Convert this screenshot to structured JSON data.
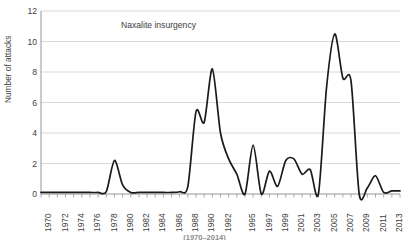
{
  "chart_data": {
    "type": "line",
    "title": "",
    "annotation": "Naxalite insurgency",
    "xlabel": "",
    "ylabel": "Number of attacks",
    "ylim": [
      0,
      12
    ],
    "yticks": [
      0,
      2,
      4,
      6,
      8,
      10,
      12
    ],
    "xlim": [
      1970,
      2014
    ],
    "xticks": [
      1970,
      1972,
      1974,
      1976,
      1978,
      1980,
      1982,
      1984,
      1986,
      1988,
      1990,
      1992,
      1994,
      1995,
      1997,
      1999,
      2001,
      2003,
      2005,
      2007,
      2009,
      2011,
      2013
    ],
    "xtick_labels": [
      "1970",
      "1972",
      "1974",
      "1976",
      "1978",
      "1980",
      "1982",
      "1984",
      "1986",
      "1988",
      "1990",
      "1992",
      "1995",
      "1997",
      "1999",
      "2001",
      "2003",
      "2005",
      "2007",
      "2009",
      "2011",
      "2013"
    ],
    "grid": "horizontal",
    "legend": "none",
    "line_color": "#1a1a1a",
    "x": [
      1970,
      1971,
      1972,
      1973,
      1974,
      1975,
      1976,
      1977,
      1978,
      1979,
      1980,
      1981,
      1982,
      1983,
      1984,
      1985,
      1986,
      1987,
      1988,
      1989,
      1990,
      1991,
      1992,
      1993,
      1994,
      1995,
      1996,
      1997,
      1998,
      1999,
      2000,
      2001,
      2002,
      2003,
      2004,
      2005,
      2006,
      2007,
      2008,
      2009,
      2010,
      2011,
      2012,
      2013,
      2014
    ],
    "values": [
      0.1,
      0.1,
      0.1,
      0.1,
      0.1,
      0.1,
      0.1,
      0.1,
      0.15,
      2.2,
      0.6,
      0.1,
      0.1,
      0.1,
      0.1,
      0.1,
      0.1,
      0.15,
      0.5,
      5.4,
      4.7,
      8.2,
      4.0,
      2.3,
      1.3,
      0.0,
      3.2,
      0.0,
      1.5,
      0.5,
      2.2,
      2.3,
      1.3,
      1.6,
      0.0,
      7.0,
      10.5,
      7.6,
      7.4,
      0.0,
      0.4,
      1.2,
      0.1,
      0.2,
      0.2
    ],
    "caption_partial": "(1970–2014)"
  },
  "axes": {
    "y_label": "Number of attacks",
    "y_tick_labels": [
      "12",
      "10",
      "8",
      "6",
      "4",
      "2",
      "0"
    ]
  }
}
